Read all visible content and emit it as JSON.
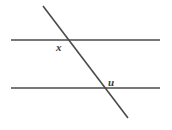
{
  "figure": {
    "kind": "geometry-diagram",
    "background_color": "#ffffff",
    "stroke_color": "#4a4a4a",
    "label_color": "#3a3a3a",
    "canvas": {
      "width": 172,
      "height": 130
    },
    "lines": [
      {
        "name": "upper-parallel-line",
        "x1": 11,
        "y1": 40,
        "x2": 160,
        "y2": 40,
        "stroke_width": 1.6
      },
      {
        "name": "lower-parallel-line",
        "x1": 11,
        "y1": 88,
        "x2": 160,
        "y2": 88,
        "stroke_width": 1.6
      },
      {
        "name": "transversal-line",
        "x1": 43,
        "y1": 6,
        "x2": 128,
        "y2": 118,
        "stroke_width": 1.6
      }
    ],
    "intersections": [
      {
        "name": "upper-intersection",
        "x": 68,
        "y": 40
      },
      {
        "name": "lower-intersection",
        "x": 105,
        "y": 88
      }
    ],
    "labels": [
      {
        "name": "angle-label-x",
        "text": "x",
        "x": 56,
        "y": 42,
        "at_intersection": "upper-intersection",
        "placement": "below-left"
      },
      {
        "name": "angle-label-u",
        "text": "u",
        "x": 108,
        "y": 77,
        "at_intersection": "lower-intersection",
        "placement": "above-right"
      }
    ]
  }
}
